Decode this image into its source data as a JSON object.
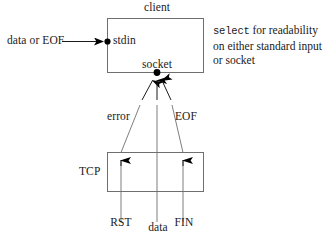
{
  "figure": {
    "title": "select for readability on either standard input or socket",
    "background_color": "#ffffff",
    "stroke_color": "#1a1a1a",
    "text_color": "#1a1a1a"
  },
  "client_box": {
    "label": "client",
    "stdin_label": "stdin",
    "socket_label": "socket"
  },
  "tcp_box": {
    "label": "TCP"
  },
  "inputs": {
    "stdin_source": "data or EOF"
  },
  "socket_events": {
    "error": "error",
    "eof": "EOF"
  },
  "tcp_segments": {
    "rst": "RST",
    "data": "data",
    "fin": "FIN"
  },
  "note": {
    "keyword": "select",
    "line1_rest": " for readability",
    "line2": "on either standard input",
    "line3": "or socket"
  }
}
